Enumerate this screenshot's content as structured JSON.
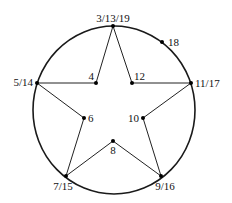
{
  "diagram": {
    "type": "star-in-circle graph",
    "circle": {
      "cx": 114,
      "cy": 110,
      "rx": 81,
      "ry": 84,
      "color": "#1a1a1a"
    },
    "nodes": [
      {
        "id": "top",
        "label": "3/13/19",
        "x": 113,
        "y": 26,
        "lx": 113,
        "ly": 22,
        "anchor": "middle"
      },
      {
        "id": "n18",
        "label": "18",
        "x": 162,
        "y": 42,
        "lx": 168,
        "ly": 46,
        "anchor": "start"
      },
      {
        "id": "left",
        "label": "5/14",
        "x": 37,
        "y": 83,
        "lx": 33,
        "ly": 86,
        "anchor": "end"
      },
      {
        "id": "right",
        "label": "11/17",
        "x": 191,
        "y": 83,
        "lx": 195,
        "ly": 87,
        "anchor": "start"
      },
      {
        "id": "n4",
        "label": "4",
        "x": 96,
        "y": 83,
        "lx": 94,
        "ly": 80,
        "anchor": "end"
      },
      {
        "id": "n12",
        "label": "12",
        "x": 132,
        "y": 83,
        "lx": 134,
        "ly": 80,
        "anchor": "start"
      },
      {
        "id": "n6",
        "label": "6",
        "x": 84,
        "y": 118,
        "lx": 88,
        "ly": 122,
        "anchor": "start"
      },
      {
        "id": "n10",
        "label": "10",
        "x": 143,
        "y": 118,
        "lx": 139,
        "ly": 122,
        "anchor": "end"
      },
      {
        "id": "n8",
        "label": "8",
        "x": 113,
        "y": 141,
        "lx": 113,
        "ly": 154,
        "anchor": "middle"
      },
      {
        "id": "bl",
        "label": "7/15",
        "x": 66,
        "y": 176,
        "lx": 63,
        "ly": 190,
        "anchor": "middle"
      },
      {
        "id": "br",
        "label": "9/16",
        "x": 161,
        "y": 176,
        "lx": 165,
        "ly": 190,
        "anchor": "middle"
      }
    ],
    "edges": [
      [
        "top",
        "n4"
      ],
      [
        "n4",
        "left"
      ],
      [
        "left",
        "n6"
      ],
      [
        "n6",
        "bl"
      ],
      [
        "bl",
        "n8"
      ],
      [
        "n8",
        "br"
      ],
      [
        "br",
        "n10"
      ],
      [
        "n10",
        "right"
      ],
      [
        "right",
        "n12"
      ],
      [
        "n12",
        "top"
      ]
    ]
  }
}
